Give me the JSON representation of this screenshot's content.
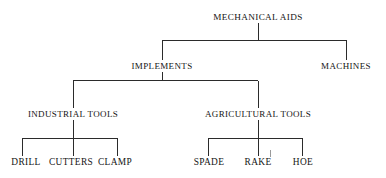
{
  "diagram": {
    "type": "hierarchy-tree",
    "line_color": "#2b2b2b",
    "background_color": "#ffffff",
    "text_color": "#141414",
    "levels": [
      {
        "level": 0,
        "nodes": [
          {
            "id": "mechanical-aids",
            "label": "MECHANICAL AIDS",
            "x": 258,
            "y": 18
          }
        ]
      },
      {
        "level": 1,
        "nodes": [
          {
            "id": "implements",
            "label": "IMPLEMENTS",
            "x": 162,
            "y": 67
          },
          {
            "id": "machines",
            "label": "MACHINES",
            "x": 346,
            "y": 67
          }
        ]
      },
      {
        "level": 2,
        "nodes": [
          {
            "id": "industrial-tools",
            "label": "INDUSTRIAL TOOLS",
            "x": 73,
            "y": 115
          },
          {
            "id": "agricultural-tools",
            "label": "AGRICULTURAL TOOLS",
            "x": 258,
            "y": 115
          }
        ]
      },
      {
        "level": 3,
        "nodes": [
          {
            "id": "drill",
            "label": "DRILL",
            "x": 26,
            "y": 163
          },
          {
            "id": "cutters",
            "label": "CUTTERS",
            "x": 71,
            "y": 163
          },
          {
            "id": "clamp",
            "label": "CLAMP",
            "x": 115,
            "y": 163
          },
          {
            "id": "spade",
            "label": "SPADE",
            "x": 209,
            "y": 163
          },
          {
            "id": "rake",
            "label": "RAKE",
            "x": 258,
            "y": 163
          },
          {
            "id": "hoe",
            "label": "HOE",
            "x": 303,
            "y": 163
          }
        ]
      }
    ],
    "edges": [
      {
        "from": "mechanical-aids",
        "to": "implements"
      },
      {
        "from": "mechanical-aids",
        "to": "machines"
      },
      {
        "from": "implements",
        "to": "industrial-tools"
      },
      {
        "from": "implements",
        "to": "agricultural-tools"
      },
      {
        "from": "industrial-tools",
        "to": "drill"
      },
      {
        "from": "industrial-tools",
        "to": "cutters"
      },
      {
        "from": "industrial-tools",
        "to": "clamp"
      },
      {
        "from": "agricultural-tools",
        "to": "spade"
      },
      {
        "from": "agricultural-tools",
        "to": "rake"
      },
      {
        "from": "agricultural-tools",
        "to": "hoe"
      }
    ]
  }
}
